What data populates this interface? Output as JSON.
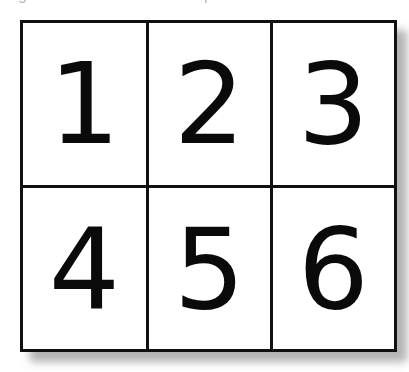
{
  "diagram": {
    "type": "numbered-grid",
    "rows": 2,
    "columns": 3,
    "cells": [
      {
        "label": "1"
      },
      {
        "label": "2"
      },
      {
        "label": "3"
      },
      {
        "label": "4"
      },
      {
        "label": "5"
      },
      {
        "label": "6"
      }
    ],
    "colors": {
      "border": "#111111",
      "cell_background": "#ffffff",
      "digit": "#0a0a0a",
      "shadow": "#9a9a9a"
    }
  },
  "cropped_header": {
    "fragment_left": "g",
    "fragment_right": "p"
  }
}
